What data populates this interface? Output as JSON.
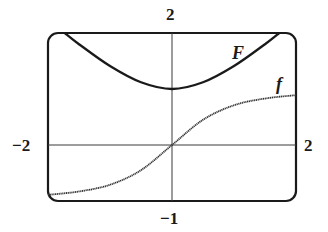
{
  "chart_data": {
    "type": "line",
    "title": "",
    "xlabel": "",
    "ylabel": "",
    "xlim": [
      -2,
      2
    ],
    "ylim": [
      -1,
      2
    ],
    "grid": false,
    "legend": "none (curves labeled directly)",
    "axis_labels": {
      "top": "2",
      "bottom": "−1",
      "left": "−2",
      "right": "2"
    },
    "series": [
      {
        "name": "F",
        "style": "solid, thick",
        "x": [
          -1.73,
          -1.5,
          -1.0,
          -0.5,
          0.0,
          0.5,
          1.0,
          1.5,
          1.73
        ],
        "y": [
          2.0,
          1.8,
          1.41,
          1.12,
          1.0,
          1.12,
          1.41,
          1.8,
          2.0
        ]
      },
      {
        "name": "f",
        "style": "dotted/grainy, medium",
        "x": [
          -2.0,
          -1.5,
          -1.0,
          -0.5,
          0.0,
          0.5,
          1.0,
          1.5,
          2.0
        ],
        "y": [
          -0.89,
          -0.83,
          -0.71,
          -0.45,
          0.0,
          0.45,
          0.71,
          0.83,
          0.89
        ]
      }
    ],
    "annotations": [
      {
        "text": "F",
        "near": [
          1.0,
          1.6
        ]
      },
      {
        "text": "f",
        "near": [
          1.75,
          1.05
        ]
      }
    ]
  },
  "labels": {
    "top": "2",
    "bottom": "−1",
    "left": "−2",
    "right": "2",
    "curve_F": "F",
    "curve_f": "f"
  },
  "colors": {
    "frame": "#1a1a1a",
    "axes": "#3a3a3a",
    "curve_F": "#1a1a1a",
    "curve_f": "#333333",
    "background": "#ffffff"
  }
}
